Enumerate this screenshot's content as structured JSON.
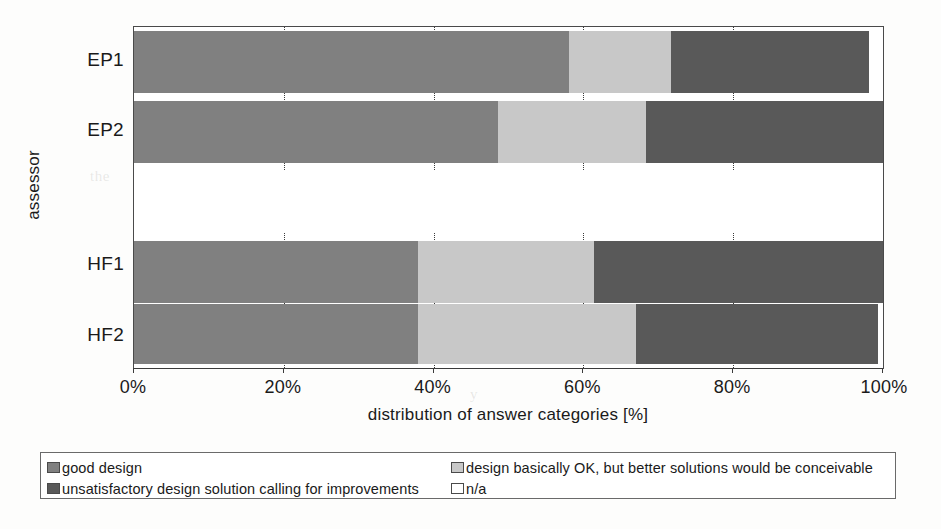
{
  "chart_data": {
    "type": "bar",
    "orientation": "horizontal",
    "stacked": true,
    "stack_mode": "percent",
    "title": "",
    "xlabel": "distribution of answer categories [%]",
    "ylabel": "assessor",
    "xlim": [
      0,
      100
    ],
    "xticks": [
      "0%",
      "20%",
      "40%",
      "60%",
      "80%",
      "100%"
    ],
    "xtick_values": [
      0,
      20,
      40,
      60,
      80,
      100
    ],
    "grid": "vertical-dotted",
    "legend_position": "bottom",
    "categories": [
      "EP1",
      "EP2",
      "",
      "HF1",
      "HF2"
    ],
    "series": [
      {
        "name": "good design",
        "color": "#808080",
        "values": [
          58.1,
          48.6,
          0,
          37.9,
          37.9
        ]
      },
      {
        "name": "design basically OK, but better solutions would be conceivable",
        "color": "#c8c8c8",
        "values": [
          13.6,
          19.8,
          0,
          23.5,
          29.1
        ]
      },
      {
        "name": "unsatisfactory design solution calling for improvements",
        "color": "#595959",
        "values": [
          26.4,
          31.6,
          0,
          38.6,
          32.4
        ]
      },
      {
        "name": "n/a",
        "color": "#ffffff",
        "values": [
          1.9,
          0.0,
          100,
          0.0,
          0.6
        ]
      }
    ]
  },
  "axes": {
    "y_title": "assessor",
    "x_title": "distribution of answer categories [%]",
    "y_labels": [
      "EP1",
      "EP2",
      "HF1",
      "HF2"
    ],
    "x_labels": [
      "0%",
      "20%",
      "40%",
      "60%",
      "80%",
      "100%"
    ]
  },
  "legend": {
    "items": [
      {
        "label": "good design",
        "swatch": "good"
      },
      {
        "label": "design basically OK, but better solutions would be conceivable",
        "swatch": "ok"
      },
      {
        "label": "unsatisfactory design solution calling for improvements",
        "swatch": "unsat"
      },
      {
        "label": "n/a",
        "swatch": "na"
      }
    ]
  },
  "background_text": {
    "line1": "the",
    "line2": "re solution",
    "line3": "y"
  }
}
